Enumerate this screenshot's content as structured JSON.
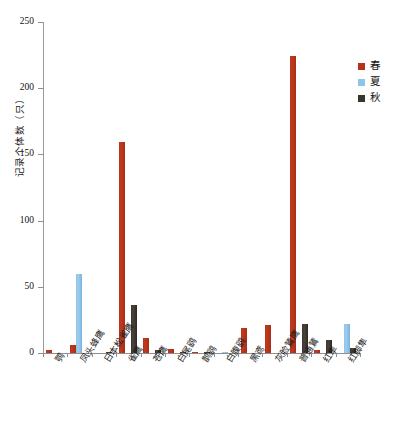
{
  "chart_data": {
    "type": "bar",
    "title": "",
    "xlabel": "",
    "ylabel": "记录个体数（只）",
    "ylim": [
      0,
      250
    ],
    "yticks": [
      0,
      50,
      100,
      150,
      200,
      250
    ],
    "grid": false,
    "legend_position": "right",
    "categories": [
      "鹗",
      "凤头蜂鹰",
      "日本松雀鹰",
      "雀鹰",
      "苍鹰",
      "白尾鹞",
      "鹊鹞",
      "白腹鹞",
      "黑鸢",
      "灰脸鵟鹰",
      "普通鵟",
      "红隼",
      "红脚隼"
    ],
    "series": [
      {
        "name": "春",
        "color": "#b5321a",
        "values": [
          2,
          6,
          0,
          159,
          11,
          3,
          1,
          0,
          19,
          21,
          224,
          2,
          0
        ]
      },
      {
        "name": "夏",
        "color": "#8ec4e8",
        "values": [
          0,
          60,
          0,
          0,
          0,
          0,
          0,
          1,
          0,
          0,
          0,
          0,
          22
        ]
      },
      {
        "name": "秋",
        "color": "#3a342e",
        "values": [
          0,
          0,
          1,
          36,
          2,
          1,
          1,
          0,
          0,
          0,
          22,
          10,
          4
        ]
      }
    ]
  },
  "legend": {
    "items": [
      {
        "label": "春",
        "color": "#b5321a"
      },
      {
        "label": "夏",
        "color": "#8ec4e8"
      },
      {
        "label": "秋",
        "color": "#3a342e"
      }
    ]
  },
  "axes": {
    "y_title": "记录个体数（只）",
    "y_tick_labels": [
      "0",
      "50",
      "100",
      "150",
      "200",
      "250"
    ]
  }
}
